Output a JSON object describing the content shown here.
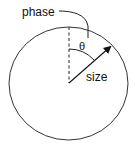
{
  "diagram": {
    "labels": {
      "phase": "phase",
      "theta": "θ",
      "size": "size"
    },
    "colors": {
      "stroke": "#333333",
      "text": "#111111",
      "background": "#ffffff"
    },
    "elements": [
      {
        "type": "circle",
        "name": "outer-circle"
      },
      {
        "type": "dashed-line",
        "name": "reference-axis",
        "direction": "vertical up from center"
      },
      {
        "type": "arrow",
        "name": "size-vector",
        "direction": "up-right from center"
      },
      {
        "type": "arc",
        "name": "theta-arc",
        "between": "reference-axis and size-vector"
      },
      {
        "type": "leader-line",
        "name": "phase-leader",
        "from": "phase label",
        "to": "theta arc"
      }
    ]
  }
}
